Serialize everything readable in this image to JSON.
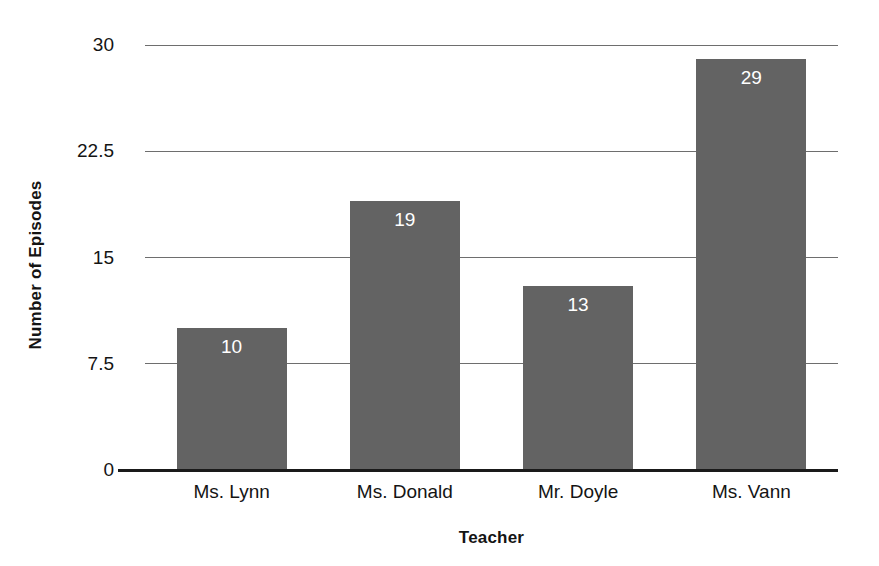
{
  "chart_data": {
    "type": "bar",
    "title": "",
    "xlabel": "Teacher",
    "ylabel": "Number of Episodes",
    "categories": [
      "Ms. Lynn",
      "Ms. Donald",
      "Mr. Doyle",
      "Ms. Vann"
    ],
    "values": [
      10,
      19,
      13,
      29
    ],
    "value_labels": [
      "10",
      "19",
      "13",
      "29"
    ],
    "ylim": [
      0,
      30
    ],
    "yticks": [
      0,
      7.5,
      15,
      22.5,
      30
    ],
    "ytick_labels": [
      "0",
      "7.5",
      "15",
      "22.5",
      "30"
    ],
    "grid": true,
    "legend": false,
    "bar_color": "#636363",
    "gridline_color": "#6e6e6e",
    "axis_color": "#1a1a1a",
    "value_label_color": "#ffffff",
    "orientation": "vertical"
  }
}
